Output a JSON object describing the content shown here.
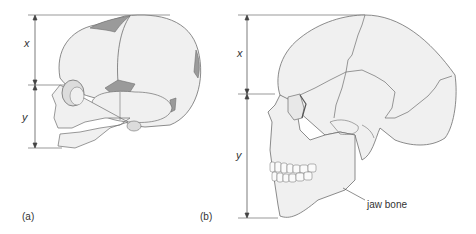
{
  "figure": {
    "panel_a": {
      "label": "(a)",
      "dimension_top": "x",
      "dimension_bottom": "y",
      "subject": "infant skull"
    },
    "panel_b": {
      "label": "(b)",
      "dimension_top": "x",
      "dimension_bottom": "y",
      "annotation": "jaw bone",
      "subject": "adult skull"
    },
    "colors": {
      "bone_fill": "#f0f0f0",
      "outline": "#6e6e6e",
      "fontanelle": "#9a9a9a",
      "dimension_line": "#444444"
    }
  }
}
